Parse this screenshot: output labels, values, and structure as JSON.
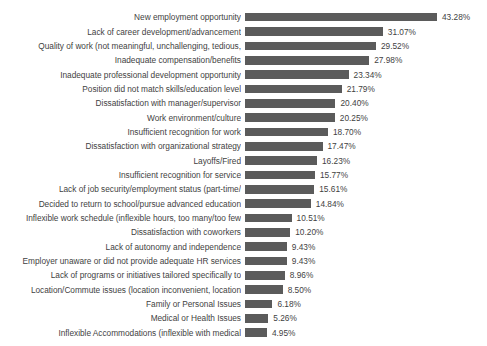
{
  "chart_data": {
    "type": "bar",
    "orientation": "horizontal",
    "title": "",
    "xlabel": "",
    "ylabel": "",
    "grid": false,
    "legend": false,
    "xlim": [
      0,
      43.28
    ],
    "value_suffix": "%",
    "bar_color": "#5b5b5b",
    "background_color": "#ffffff",
    "categories": [
      "New employment opportunity",
      "Lack of career development/advancement",
      "Quality of work (not meaningful, unchallenging, tedious,",
      "Inadequate compensation/benefits",
      "Inadequate professional development opportunity",
      "Position did not match skills/education level",
      "Dissatisfaction with manager/supervisor",
      "Work environment/culture",
      "Insufficient recognition for work",
      "Dissatisfaction with organizational strategy",
      "Layoffs/Fired",
      "Insufficient recognition for service",
      "Lack of job security/employment status (part-time/",
      "Decided to return to school/pursue advanced education",
      "Inflexible work schedule (inflexible hours, too many/too few",
      "Dissatisfaction with coworkers",
      "Lack of autonomy and independence",
      "Employer unaware or did not provide adequate HR services",
      "Lack of programs or initiatives tailored specifically to",
      "Location/Commute issues (location inconvenient, location",
      "Family or Personal Issues",
      "Medical or Health Issues",
      "Inflexible Accommodations (inflexible with medical"
    ],
    "values": [
      43.28,
      31.07,
      29.52,
      27.98,
      23.34,
      21.79,
      20.4,
      20.25,
      18.7,
      17.47,
      16.23,
      15.77,
      15.61,
      14.84,
      10.51,
      10.2,
      9.43,
      9.43,
      8.96,
      8.5,
      6.18,
      5.26,
      4.95
    ],
    "value_labels": [
      "43.28%",
      "31.07%",
      "29.52%",
      "27.98%",
      "23.34%",
      "21.79%",
      "20.40%",
      "20.25%",
      "18.70%",
      "17.47%",
      "16.23%",
      "15.77%",
      "15.61%",
      "14.84%",
      "10.51%",
      "10.20%",
      "9.43%",
      "9.43%",
      "8.96%",
      "8.50%",
      "6.18%",
      "5.26%",
      "4.95%"
    ]
  }
}
